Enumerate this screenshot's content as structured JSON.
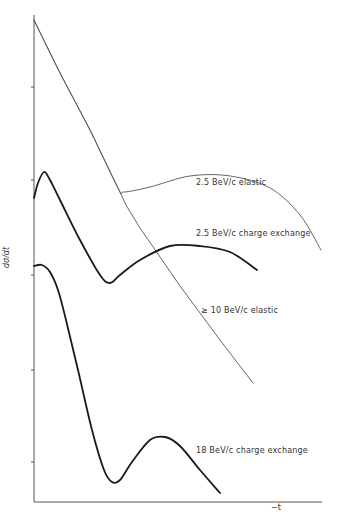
{
  "chart_data": {
    "type": "line",
    "title": "",
    "xlabel": "−t",
    "ylabel": "dσ/dt",
    "grid": false,
    "legend_position": "inline-labels",
    "axis_ticks_y_px": [
      87,
      180,
      275,
      370,
      462
    ],
    "series": [
      {
        "name": "2.5 BeV/c elastic",
        "style": "thin",
        "points_px": [
          [
            34,
            20
          ],
          [
            60,
            73
          ],
          [
            90,
            130
          ],
          [
            118,
            188
          ],
          [
            124,
            192
          ],
          [
            150,
            187
          ],
          [
            190,
            176
          ],
          [
            230,
            176
          ],
          [
            270,
            188
          ],
          [
            300,
            215
          ],
          [
            321,
            250
          ]
        ]
      },
      {
        "name": "≥ 10 BeV/c elastic",
        "style": "thin",
        "points_px": [
          [
            34,
            20
          ],
          [
            60,
            73
          ],
          [
            90,
            130
          ],
          [
            118,
            188
          ],
          [
            126,
            205
          ],
          [
            140,
            228
          ],
          [
            180,
            286
          ],
          [
            220,
            340
          ],
          [
            253,
            383
          ]
        ]
      },
      {
        "name": "2.5 BeV/c charge exchange",
        "style": "thick",
        "points_px": [
          [
            34,
            198
          ],
          [
            38,
            183
          ],
          [
            44,
            172
          ],
          [
            50,
            180
          ],
          [
            60,
            200
          ],
          [
            80,
            240
          ],
          [
            100,
            275
          ],
          [
            110,
            283
          ],
          [
            120,
            275
          ],
          [
            140,
            260
          ],
          [
            170,
            246
          ],
          [
            200,
            246
          ],
          [
            230,
            252
          ],
          [
            257,
            270
          ]
        ]
      },
      {
        "name": "18 BeV/c charge exchange",
        "style": "thick",
        "points_px": [
          [
            34,
            266
          ],
          [
            42,
            265
          ],
          [
            50,
            272
          ],
          [
            58,
            290
          ],
          [
            66,
            320
          ],
          [
            78,
            370
          ],
          [
            92,
            430
          ],
          [
            104,
            470
          ],
          [
            112,
            482
          ],
          [
            120,
            480
          ],
          [
            132,
            462
          ],
          [
            150,
            440
          ],
          [
            165,
            437
          ],
          [
            180,
            446
          ],
          [
            200,
            470
          ],
          [
            220,
            493
          ]
        ]
      }
    ],
    "annotations": [
      {
        "text": "2.5 BeV/c  elastic",
        "x": 196,
        "y": 185
      },
      {
        "text": "2.5 BeV/c charge exchange",
        "x": 196,
        "y": 235
      },
      {
        "text": "≥ 10 BeV/c  elastic",
        "x": 201,
        "y": 312
      },
      {
        "text": "18 BeV/c  charge exchange",
        "x": 196,
        "y": 452
      }
    ],
    "axes": {
      "x_start": 34,
      "x_end": 322,
      "y_top": 15,
      "y_bottom": 502
    }
  },
  "labels": {
    "elastic_25": "2.5 BeV/c  elastic",
    "cex_25": "2.5 BeV/c charge exchange",
    "elastic_10": "≥ 10 BeV/c  elastic",
    "cex_18": "18 BeV/c  charge exchange",
    "xlabel": "−t",
    "ylabel": "dσ/dt"
  }
}
